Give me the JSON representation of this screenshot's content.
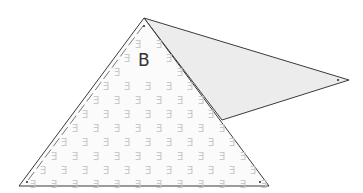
{
  "diagram": {
    "label": "B",
    "pattern_glyph": "Ǝ",
    "colors": {
      "stroke": "#3a3a3a",
      "main_fill": "#fbfbfb",
      "flap_fill": "#ececec",
      "pattern": "#c9c9c9",
      "dash": "#777777"
    },
    "main_triangle": [
      [
        144,
        18
      ],
      [
        19,
        186
      ],
      [
        269,
        186
      ]
    ],
    "flap_triangle": [
      [
        144,
        18
      ],
      [
        349,
        80
      ],
      [
        222,
        120
      ]
    ],
    "label_position": [
      138,
      50
    ]
  }
}
